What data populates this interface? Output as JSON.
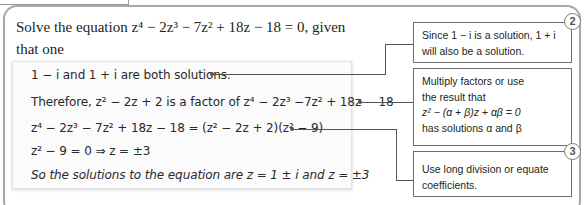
{
  "question": {
    "line1": "Solve the equation z⁴ − 2z³ − 7z² + 18z − 18 = 0, given that one",
    "line2": "of the solutions is 1 − i"
  },
  "working": {
    "lines": [
      "1 − i and 1 + i are both solutions.",
      "Therefore, z² − 2z + 2 is a factor of z⁴ − 2z³ −7z² + 18z − 18",
      "z⁴ − 2z³ − 7z² + 18z − 18 = (z² − 2z + 2)(z² − 9)",
      "z² − 9 = 0 ⇒ z = ±3",
      "So the solutions to the equation are z = 1 ± i and z = ±3"
    ]
  },
  "callouts": [
    {
      "text_line1": "Since 1 − i is a solution, 1 + i",
      "text_line2": "will also be a solution."
    },
    {
      "text_line1": "Multiply factors or use",
      "text_line2": "the result that",
      "text_line3": "z² − (α + β)z + αβ = 0",
      "text_line4": "has solutions α and β"
    },
    {
      "text_line1": "Use long division or equate",
      "text_line2": "coefficients."
    }
  ],
  "badges": [
    "2",
    "3"
  ]
}
